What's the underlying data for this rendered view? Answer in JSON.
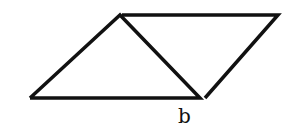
{
  "diagram": {
    "stroke_color": "#111111",
    "labels": [
      {
        "text": "b",
        "x": 181,
        "y": 104
      }
    ],
    "left_triangle": [
      [
        30,
        98
      ],
      [
        120,
        15
      ],
      [
        200,
        98
      ]
    ],
    "right_triangle": [
      [
        122,
        15
      ],
      [
        278,
        15
      ],
      [
        205,
        98
      ]
    ]
  }
}
